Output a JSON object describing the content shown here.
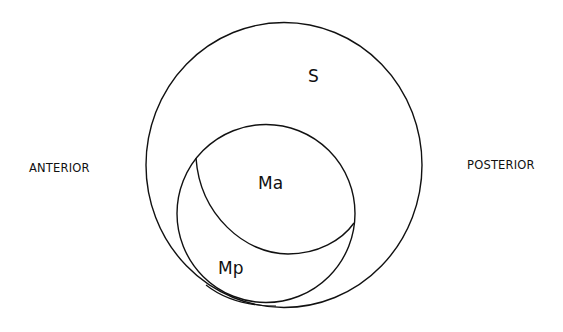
{
  "diagram": {
    "labels": {
      "left": "ANTERIOR",
      "right": "POSTERIOR",
      "outer": "S",
      "upper_inner": "Ma",
      "lower_inner": "Mp"
    },
    "colors": {
      "stroke": "#111111",
      "background": "#ffffff",
      "text": "#111111"
    }
  }
}
